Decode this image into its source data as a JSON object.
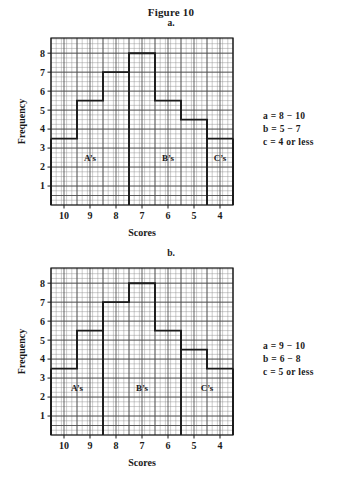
{
  "figure": {
    "title": "Figure 10"
  },
  "panels": [
    {
      "letter": "a.",
      "legend": [
        "a  =  8  −  10",
        "b  =  5  −  7",
        "c  =  4 or less"
      ]
    },
    {
      "letter": "b.",
      "legend": [
        "a  =  9  −  10",
        "b  =  6  −  8",
        "c  =  5 or less"
      ]
    }
  ],
  "chart_data": [
    {
      "type": "bar",
      "title": "a.",
      "xlabel": "Scores",
      "ylabel": "Frequency",
      "categories": [
        10,
        9,
        8,
        7,
        6,
        5,
        4
      ],
      "values": [
        3.5,
        5.5,
        7,
        8,
        5.5,
        4.5,
        3.5
      ],
      "xlim": [
        10.5,
        3.5
      ],
      "ylim": [
        0,
        8.8
      ],
      "x_ticks": [
        10,
        9,
        8,
        7,
        6,
        5,
        4
      ],
      "y_ticks": [
        1,
        2,
        3,
        4,
        5,
        6,
        7,
        8
      ],
      "grid": true,
      "x_axis_reversed": true,
      "annotations": [
        {
          "label": "A’s",
          "score_from": 10.5,
          "score_to": 7.5,
          "y": 2.5
        },
        {
          "label": "B’s",
          "score_from": 7.5,
          "score_to": 4.5,
          "y": 2.5
        },
        {
          "label": "C’s",
          "score_from": 4.5,
          "score_to": 3.5,
          "y": 2.5
        }
      ],
      "grade_boundaries": [
        10.5,
        7.5,
        4.5,
        3.5
      ]
    },
    {
      "type": "bar",
      "title": "b.",
      "xlabel": "Scores",
      "ylabel": "Frequency",
      "categories": [
        10,
        9,
        8,
        7,
        6,
        5,
        4
      ],
      "values": [
        3.5,
        5.5,
        7,
        8,
        5.5,
        4.5,
        3.5
      ],
      "xlim": [
        10.5,
        3.5
      ],
      "ylim": [
        0,
        8.8
      ],
      "x_ticks": [
        10,
        9,
        8,
        7,
        6,
        5,
        4
      ],
      "y_ticks": [
        1,
        2,
        3,
        4,
        5,
        6,
        7,
        8
      ],
      "grid": true,
      "x_axis_reversed": true,
      "annotations": [
        {
          "label": "A’s",
          "score_from": 10.5,
          "score_to": 8.5,
          "y": 2.5
        },
        {
          "label": "B’s",
          "score_from": 8.5,
          "score_to": 5.5,
          "y": 2.5
        },
        {
          "label": "C’s",
          "score_from": 5.5,
          "score_to": 3.5,
          "y": 2.5
        }
      ],
      "grade_boundaries": [
        10.5,
        8.5,
        5.5,
        3.5
      ]
    }
  ],
  "axis_labels": {
    "y": "Frequency",
    "x": "Scores"
  },
  "colors": {
    "ink": "#1a1a1a",
    "grid_minor": "#8d8d8d",
    "grid_major": "#4a4a4a",
    "background": "#ffffff"
  }
}
